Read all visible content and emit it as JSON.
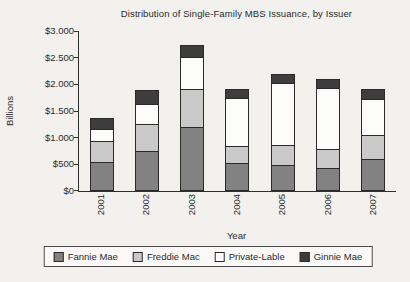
{
  "chart_data": {
    "type": "bar",
    "stacked": true,
    "title": "Distribution of Single-Family MBS Issuance, by Issuer",
    "xlabel": "Year",
    "ylabel": "Billions",
    "categories": [
      "2001",
      "2002",
      "2003",
      "2004",
      "2005",
      "2006",
      "2007"
    ],
    "series": [
      {
        "name": "Fannie Mae",
        "color": "#828282",
        "values": [
          520,
          730,
          1180,
          510,
          460,
          420,
          580
        ]
      },
      {
        "name": "Freddie Mac",
        "color": "#c9c9c9",
        "values": [
          400,
          510,
          720,
          320,
          380,
          350,
          450
        ]
      },
      {
        "name": "Private-Lable",
        "color": "#fcfcfb",
        "values": [
          230,
          380,
          600,
          890,
          1160,
          1140,
          680
        ]
      },
      {
        "name": "Ginnie Mae",
        "color": "#3d3d3d",
        "values": [
          190,
          230,
          200,
          160,
          150,
          150,
          170
        ]
      }
    ],
    "ylim": [
      0,
      3000
    ],
    "ytick_step": 500,
    "ytick_labels": [
      "$0",
      "$500",
      "$1.000",
      "$1.500",
      "$2.000",
      "$2.500",
      "$3.000"
    ],
    "grid": false,
    "legend_position": "bottom",
    "colors": {
      "axis": "#2f2f2f",
      "text": "#2b2b2b",
      "background": "#f2f1ee"
    }
  }
}
